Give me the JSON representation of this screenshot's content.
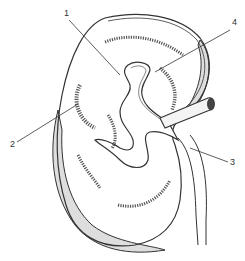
{
  "diagram": {
    "labels": [
      {
        "id": "1",
        "text": "1",
        "x": 64,
        "y": 9
      },
      {
        "id": "2",
        "text": "2",
        "x": 10,
        "y": 145
      },
      {
        "id": "3",
        "text": "3",
        "x": 231,
        "y": 164
      },
      {
        "id": "4",
        "text": "4",
        "x": 233,
        "y": 22
      }
    ]
  },
  "colors": {
    "line": "#333333",
    "fat_fill": "#dedede",
    "background": "#ffffff"
  }
}
